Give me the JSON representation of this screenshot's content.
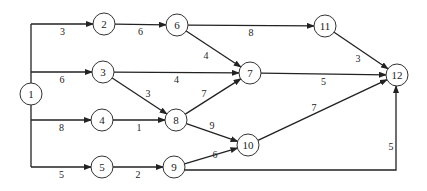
{
  "diagram": {
    "type": "activity-network",
    "nodes": [
      {
        "id": "1",
        "label": "1"
      },
      {
        "id": "2",
        "label": "2"
      },
      {
        "id": "3",
        "label": "3"
      },
      {
        "id": "4",
        "label": "4"
      },
      {
        "id": "5",
        "label": "5"
      },
      {
        "id": "6",
        "label": "6"
      },
      {
        "id": "7",
        "label": "7"
      },
      {
        "id": "8",
        "label": "8"
      },
      {
        "id": "9",
        "label": "9"
      },
      {
        "id": "10",
        "label": "10"
      },
      {
        "id": "11",
        "label": "11"
      },
      {
        "id": "12",
        "label": "12"
      }
    ],
    "edges": [
      {
        "from": "1",
        "to": "2",
        "weight": "3"
      },
      {
        "from": "1",
        "to": "3",
        "weight": "6"
      },
      {
        "from": "1",
        "to": "4",
        "weight": "8"
      },
      {
        "from": "1",
        "to": "5",
        "weight": "5"
      },
      {
        "from": "2",
        "to": "6",
        "weight": "6"
      },
      {
        "from": "6",
        "to": "11",
        "weight": "8"
      },
      {
        "from": "6",
        "to": "7",
        "weight": "4"
      },
      {
        "from": "3",
        "to": "7",
        "weight": "4"
      },
      {
        "from": "3",
        "to": "8",
        "weight": "3"
      },
      {
        "from": "4",
        "to": "8",
        "weight": "1"
      },
      {
        "from": "8",
        "to": "7",
        "weight": "7"
      },
      {
        "from": "8",
        "to": "10",
        "weight": "9"
      },
      {
        "from": "5",
        "to": "9",
        "weight": "2"
      },
      {
        "from": "9",
        "to": "10",
        "weight": "6"
      },
      {
        "from": "9",
        "to": "12",
        "weight": "5"
      },
      {
        "from": "7",
        "to": "12",
        "weight": "5"
      },
      {
        "from": "11",
        "to": "12",
        "weight": "3"
      },
      {
        "from": "10",
        "to": "12",
        "weight": "7"
      }
    ]
  }
}
